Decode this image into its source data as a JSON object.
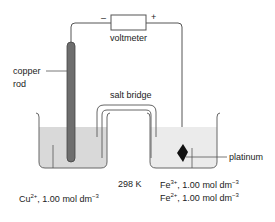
{
  "diagram": {
    "voltmeter": {
      "label": "voltmeter",
      "negative_terminal": "–",
      "positive_terminal": "+"
    },
    "left_half_cell": {
      "electrode_label_line1": "copper",
      "electrode_label_line2": "rod",
      "solution_ion": "Cu",
      "solution_ion_charge": "2+",
      "solution_conc": ", 1.00 mol dm",
      "solution_conc_exp": "−3"
    },
    "salt_bridge": {
      "label": "salt bridge"
    },
    "temperature": {
      "label": "298 K"
    },
    "right_half_cell": {
      "electrode_label": "platinum",
      "solution_line1_ion": "Fe",
      "solution_line1_charge": "3+",
      "solution_line1_conc": ", 1.00 mol dm",
      "solution_line1_exp": "−3",
      "solution_line2_ion": "Fe",
      "solution_line2_charge": "2+",
      "solution_line2_conc": ", 1.00 mol dm",
      "solution_line2_exp": "−3"
    },
    "colors": {
      "wire": "#555555",
      "beaker_outline": "#666666",
      "left_solution": "#d9d9d9",
      "right_solution": "#ebebeb",
      "copper_rod": "#6e6e6e",
      "platinum": "#111111",
      "text": "#222222"
    }
  }
}
